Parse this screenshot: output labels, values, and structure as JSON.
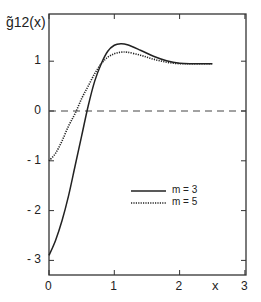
{
  "chart_data": {
    "type": "line",
    "title": "",
    "xlabel": "x",
    "ylabel": "g̃12(x)",
    "xlim": [
      0,
      3
    ],
    "ylim": [
      -3.2,
      1.9
    ],
    "xticks": [
      "0",
      "1",
      "2",
      "3"
    ],
    "yticks": [
      "1",
      "0",
      "-1",
      "-2",
      "-3"
    ],
    "grid": false,
    "legend_position": "lower right",
    "reference_line": {
      "y": 0,
      "style": "dashed"
    },
    "series": [
      {
        "name": "m = 3",
        "style": "solid",
        "x": [
          0,
          0.1,
          0.2,
          0.3,
          0.4,
          0.5,
          0.6,
          0.7,
          0.8,
          0.9,
          1.0,
          1.1,
          1.2,
          1.4,
          1.6,
          1.8,
          2.0,
          2.2,
          2.5
        ],
        "y": [
          -2.9,
          -2.6,
          -2.2,
          -1.7,
          -1.1,
          -0.5,
          0.1,
          0.6,
          0.95,
          1.2,
          1.32,
          1.35,
          1.33,
          1.22,
          1.1,
          1.01,
          0.96,
          0.95,
          0.95
        ]
      },
      {
        "name": "m = 5",
        "style": "dotted",
        "x": [
          0,
          0.1,
          0.2,
          0.3,
          0.4,
          0.5,
          0.6,
          0.7,
          0.8,
          0.9,
          1.0,
          1.1,
          1.2,
          1.4,
          1.6,
          1.8,
          2.0,
          2.2,
          2.5
        ],
        "y": [
          -1.0,
          -0.85,
          -0.6,
          -0.3,
          -0.05,
          0.25,
          0.5,
          0.75,
          0.95,
          1.08,
          1.15,
          1.18,
          1.18,
          1.12,
          1.04,
          0.98,
          0.95,
          0.95,
          0.95
        ]
      }
    ]
  },
  "labels": {
    "ylabel": "g̃12(x)",
    "xlabel": "x",
    "legend_m3": "m = 3",
    "legend_m5": "m = 5"
  }
}
